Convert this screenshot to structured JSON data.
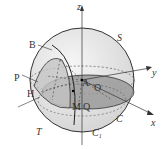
{
  "figure": {
    "type": "sphere-geometry-diagram",
    "axes": {
      "x": "x",
      "y": "y",
      "z": "z"
    },
    "labels": {
      "B": "B",
      "S": "S",
      "P": "P",
      "H": "H",
      "A": "A",
      "O": "O",
      "M": "M",
      "Q": "Q",
      "T": "T",
      "C": "C",
      "C1": "C",
      "C1_sub": "1"
    },
    "colors": {
      "sphere_fill": "#e6e6e6",
      "plane_fill": "#9a9a9a",
      "cap_fill": "#c8c8c8",
      "stroke": "#333333"
    }
  }
}
